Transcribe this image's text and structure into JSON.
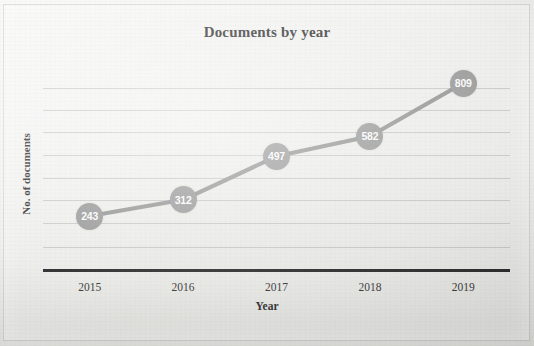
{
  "chart_data": {
    "type": "line",
    "title": "Documents by year",
    "xlabel": "Year",
    "ylabel": "No. of documents",
    "categories": [
      "2015",
      "2016",
      "2017",
      "2018",
      "2019"
    ],
    "values": [
      243,
      312,
      497,
      582,
      809
    ],
    "data_labels": [
      "243",
      "312",
      "497",
      "582",
      "809"
    ],
    "series": [
      {
        "name": "No. of documents",
        "values": [
          243,
          312,
          497,
          582,
          809
        ]
      }
    ],
    "ylim": [
      0,
      800
    ],
    "gridlines": [
      100,
      200,
      300,
      400,
      500,
      600,
      700,
      800
    ],
    "grid": true,
    "legend": "none",
    "marker_color": "#919191",
    "line_color": "#8c8c8c",
    "label_text_color": "#fbfbfb",
    "axis_color": "#1d1d1d",
    "gridline_color": "#8c8c8c"
  }
}
